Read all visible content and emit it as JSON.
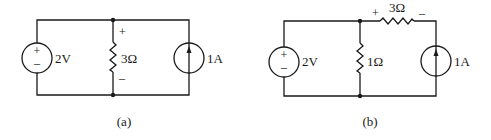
{
  "figure": {
    "circuits": [
      {
        "id": "a",
        "caption": "(a)",
        "voltage_source": {
          "label": "2V",
          "plus": "+",
          "minus": "–"
        },
        "shunt_resistor": {
          "label": "3Ω",
          "plus": "+",
          "minus": "–"
        },
        "current_source": {
          "label": "1A",
          "direction": "up"
        }
      },
      {
        "id": "b",
        "caption": "(b)",
        "voltage_source": {
          "label": "2V",
          "plus": "+",
          "minus": "–"
        },
        "shunt_resistor": {
          "label": "1Ω"
        },
        "series_resistor": {
          "label": "3Ω",
          "plus": "+",
          "minus": "–"
        },
        "current_source": {
          "label": "1A",
          "direction": "up"
        }
      }
    ]
  }
}
